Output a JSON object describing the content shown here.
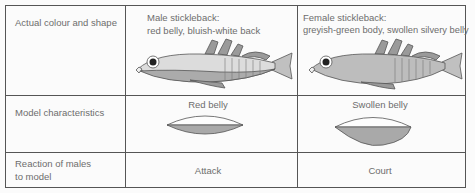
{
  "rows": [
    {
      "label": "Actual colour and shape"
    },
    {
      "label": "Model characteristics"
    },
    {
      "label_line1": "Reaction of males",
      "label_line2": "to model"
    }
  ],
  "male": {
    "title": "Male stickleback:",
    "desc": "red belly, bluish-white back",
    "model": "Red belly",
    "reaction": "Attack"
  },
  "female": {
    "title": "Female stickleback:",
    "desc": "greyish-green body, swollen silvery belly",
    "model": "Swollen belly",
    "reaction": "Court"
  },
  "colors": {
    "border": "#555555",
    "fish_back": "#d6d6d6",
    "fish_belly": "#a8a8a8",
    "model_fill": "#a9a9a9"
  }
}
